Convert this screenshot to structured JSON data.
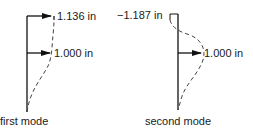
{
  "diagram": {
    "first_mode": {
      "caption": "first mode",
      "top_label": "1.136 in",
      "mid_label": "1.000 in"
    },
    "second_mode": {
      "caption": "second mode",
      "top_label": "−1.187 in",
      "mid_label": "1.000 in"
    }
  }
}
